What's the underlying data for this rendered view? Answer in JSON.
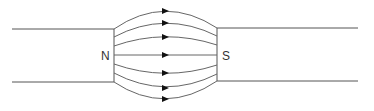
{
  "diagram": {
    "labels": {
      "north": "N",
      "south": "S"
    },
    "colors": {
      "line": "#555555",
      "arrow": "#111111"
    },
    "field_line_count": 7
  }
}
